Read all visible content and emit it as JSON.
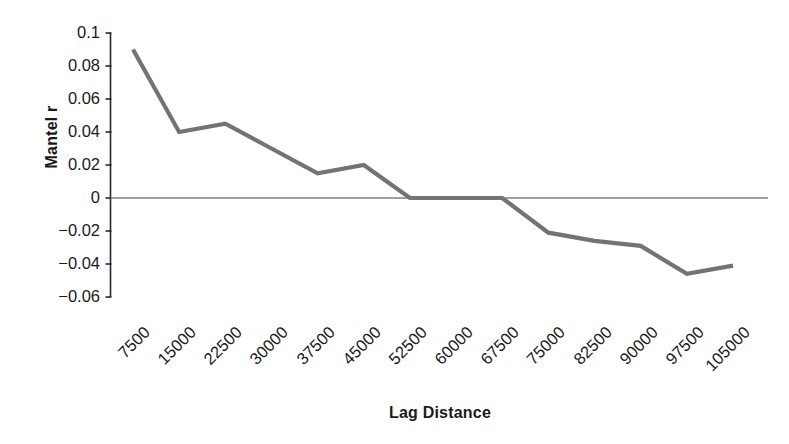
{
  "chart_data": {
    "type": "line",
    "title": "",
    "xlabel": "Lag Distance",
    "ylabel": "Mantel r",
    "categories": [
      "7500",
      "15000",
      "22500",
      "30000",
      "37500",
      "45000",
      "52500",
      "60000",
      "67500",
      "75000",
      "82500",
      "90000",
      "97500",
      "105000"
    ],
    "values": [
      0.09,
      0.04,
      0.045,
      0.03,
      0.015,
      0.02,
      0.0,
      0.0,
      0.0,
      -0.021,
      -0.026,
      -0.029,
      -0.046,
      -0.041
    ],
    "series": [
      {
        "name": "Mantel r",
        "values": [
          0.09,
          0.04,
          0.045,
          0.03,
          0.015,
          0.02,
          0.0,
          0.0,
          0.0,
          -0.021,
          -0.026,
          -0.029,
          -0.046,
          -0.041
        ],
        "color": "#737373"
      }
    ],
    "ylim": [
      -0.06,
      0.1
    ],
    "yticks": [
      "0.1",
      "0.08",
      "0.06",
      "0.04",
      "0.02",
      "0",
      "−0.02",
      "−0.04",
      "−0.06"
    ],
    "ytick_values": [
      0.1,
      0.08,
      0.06,
      0.04,
      0.02,
      0,
      -0.02,
      -0.04,
      -0.06
    ],
    "grid": false,
    "legend": "none",
    "zero_line": true,
    "zero_line_color": "#808080",
    "axis_color": "#262626",
    "xtick_rotation": -45
  }
}
